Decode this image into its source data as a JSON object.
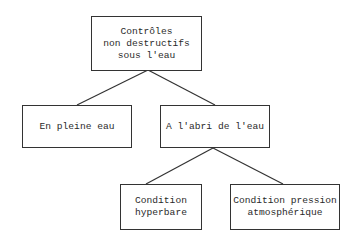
{
  "diagram": {
    "type": "tree",
    "nodes": {
      "root": {
        "label": "Contrôles\nnon destructifs\nsous l'eau"
      },
      "open_water": {
        "label": "En pleine eau"
      },
      "sheltered": {
        "label": "A l'abri de l'eau"
      },
      "hyperbaric": {
        "label": "Condition\nhyperbare"
      },
      "atmospheric": {
        "label": "Condition pression\natmosphérique"
      }
    },
    "edges": [
      {
        "from": "root",
        "to": "open_water"
      },
      {
        "from": "root",
        "to": "sheltered"
      },
      {
        "from": "sheltered",
        "to": "hyperbaric"
      },
      {
        "from": "sheltered",
        "to": "atmospheric"
      }
    ],
    "colors": {
      "line": "#333333",
      "text": "#2a2a2a",
      "background": "#ffffff"
    }
  }
}
